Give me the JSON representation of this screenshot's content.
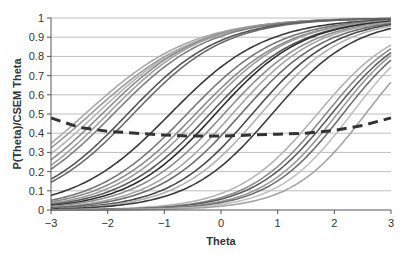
{
  "chart_data": {
    "type": "line",
    "title": "",
    "xlabel": "Theta",
    "ylabel": "P(Theta)/CSEM Theta",
    "xlim": [
      -3,
      3
    ],
    "ylim": [
      0,
      1
    ],
    "x_ticks": [
      "-3",
      "-2",
      "-1",
      "0",
      "1",
      "2",
      "3"
    ],
    "y_ticks": [
      "0",
      "0.1",
      "0.2",
      "0.3",
      "0.4",
      "0.5",
      "0.6",
      "0.7",
      "0.8",
      "0.9",
      "1"
    ],
    "grid": "horizontal",
    "legend": "none",
    "series_description": "Item characteristic curves (logistic, P(theta)) for many items plus a dashed CSEM curve",
    "icc_items": [
      {
        "a": 0.62,
        "b": -2.4,
        "color": "#a9a9a9"
      },
      {
        "a": 0.62,
        "b": -2.3,
        "color": "#9a9a9a"
      },
      {
        "a": 0.65,
        "b": -2.2,
        "color": "#b5b5b5"
      },
      {
        "a": 0.68,
        "b": -2.1,
        "color": "#8c8c8c"
      },
      {
        "a": 0.7,
        "b": -2.0,
        "color": "#a0a0a0"
      },
      {
        "a": 0.7,
        "b": -1.9,
        "color": "#7f7f7f"
      },
      {
        "a": 0.72,
        "b": -1.65,
        "color": "#555555"
      },
      {
        "a": 0.72,
        "b": -1.55,
        "color": "#6a6a6a"
      },
      {
        "a": 0.7,
        "b": -0.9,
        "color": "#3a3a3a"
      },
      {
        "a": 0.72,
        "b": -0.6,
        "color": "#777777"
      },
      {
        "a": 0.72,
        "b": -0.45,
        "color": "#8a8a8a"
      },
      {
        "a": 0.74,
        "b": -0.35,
        "color": "#9c9c9c"
      },
      {
        "a": 0.74,
        "b": -0.2,
        "color": "#5a5a5a"
      },
      {
        "a": 0.76,
        "b": -0.1,
        "color": "#2e2e2e"
      },
      {
        "a": 0.76,
        "b": 0.05,
        "color": "#8e8e8e"
      },
      {
        "a": 0.78,
        "b": 0.2,
        "color": "#a6a6a6"
      },
      {
        "a": 0.78,
        "b": 0.35,
        "color": "#6e6e6e"
      },
      {
        "a": 0.8,
        "b": 0.55,
        "color": "#4a4a4a"
      },
      {
        "a": 0.8,
        "b": 0.7,
        "color": "#b0b0b0"
      },
      {
        "a": 0.8,
        "b": 0.9,
        "color": "#3c3c3c"
      },
      {
        "a": 0.82,
        "b": 1.7,
        "color": "#b3b3b3"
      },
      {
        "a": 0.85,
        "b": 1.85,
        "color": "#8a8a8a"
      },
      {
        "a": 0.85,
        "b": 1.95,
        "color": "#5c5c5c"
      },
      {
        "a": 0.88,
        "b": 2.05,
        "color": "#9a9a9a"
      },
      {
        "a": 0.88,
        "b": 2.15,
        "color": "#707070"
      },
      {
        "a": 0.9,
        "b": 2.3,
        "color": "#c0c0c0"
      },
      {
        "a": 0.9,
        "b": 2.55,
        "color": "#a4a4a4"
      }
    ],
    "icc_scale_D": 1.7,
    "csem_curve": {
      "name": "CSEM Theta",
      "style": "dashed",
      "color": "#333333",
      "x": [
        -3,
        -2.5,
        -2,
        -1.5,
        -1,
        -0.5,
        0,
        0.5,
        1,
        1.5,
        2,
        2.5,
        3
      ],
      "y": [
        0.48,
        0.43,
        0.41,
        0.4,
        0.39,
        0.385,
        0.385,
        0.39,
        0.395,
        0.4,
        0.415,
        0.44,
        0.48
      ]
    }
  },
  "colors": {
    "grid": "#bdbdbd",
    "axis": "#555555",
    "background": "#ffffff"
  }
}
